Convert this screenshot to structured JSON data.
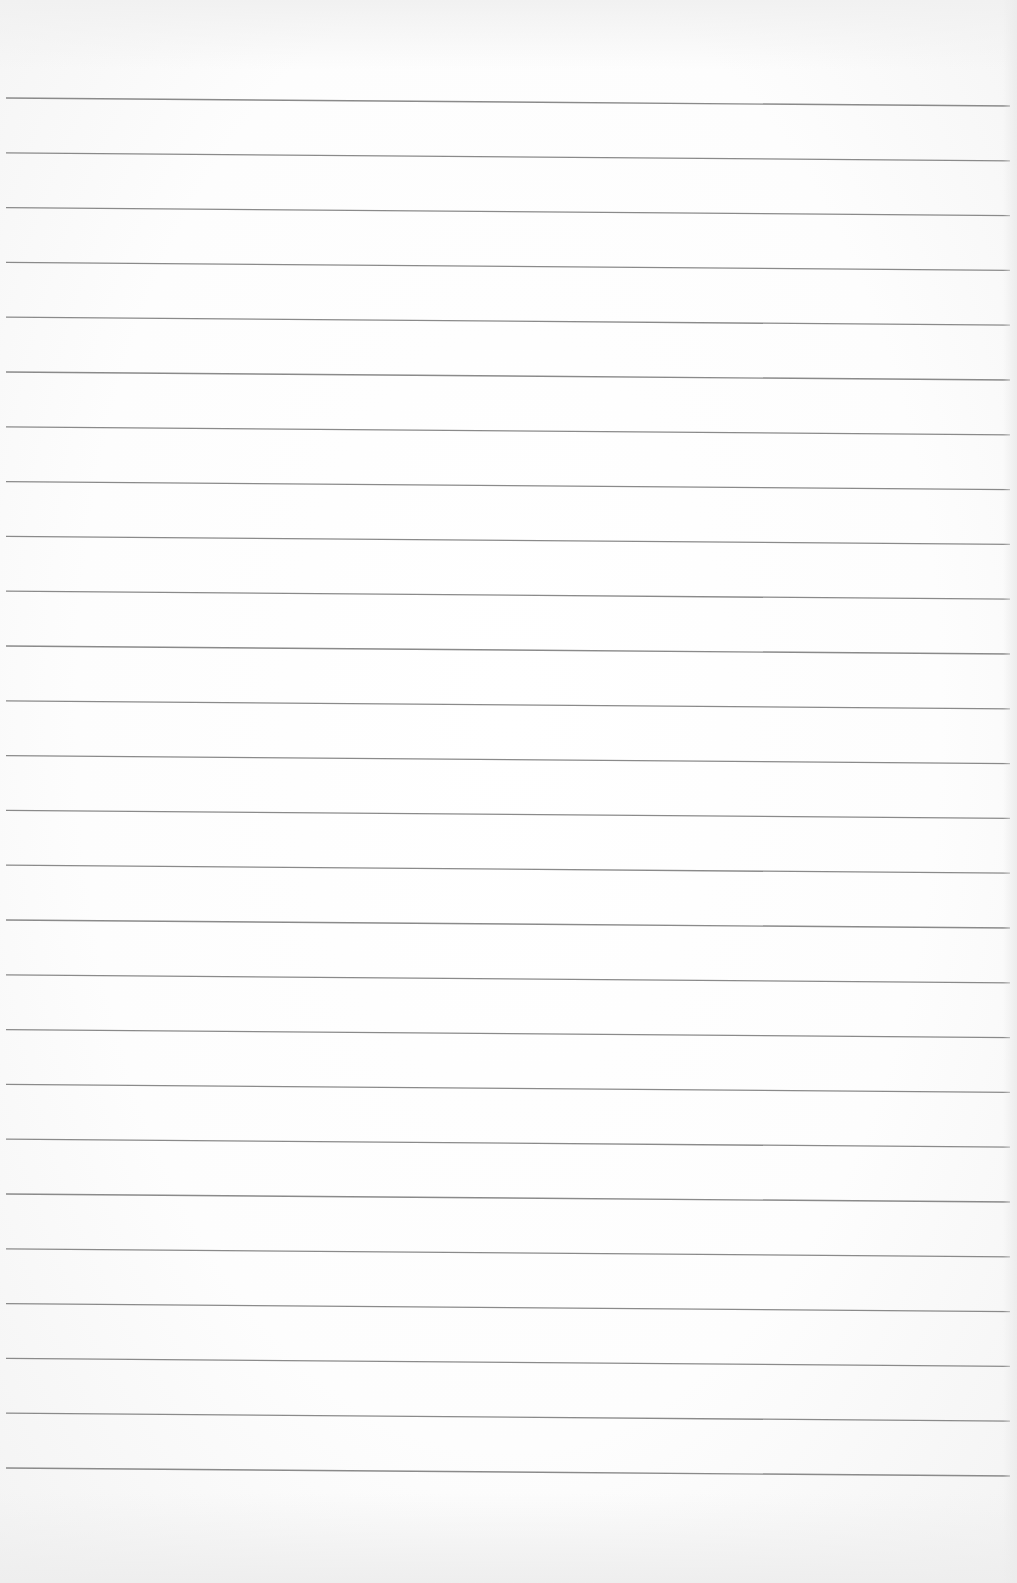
{
  "page": {
    "type": "lined-paper",
    "background_color": "#fbfbfb",
    "line_color": "#8a8a8a",
    "line_count": 26,
    "first_line_y_left": 98,
    "first_line_y_right": 106,
    "line_spacing": 54.8,
    "line_x_start": 6,
    "line_x_end": 1010
  }
}
